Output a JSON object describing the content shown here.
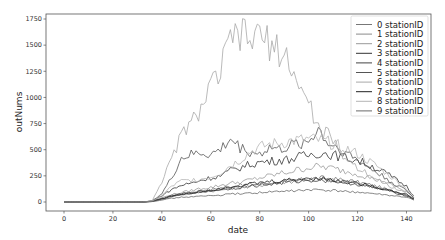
{
  "chart_data": {
    "type": "line",
    "title": "",
    "xlabel": "date",
    "ylabel": "outNums",
    "xlim": [
      -7,
      150
    ],
    "ylim": [
      -90,
      1780
    ],
    "xticks": [
      0,
      20,
      40,
      60,
      80,
      100,
      120,
      140
    ],
    "yticks": [
      0,
      250,
      500,
      750,
      1000,
      1250,
      1500,
      1750
    ],
    "grid": false,
    "legend_position": "upper right",
    "x": [
      0,
      4,
      8,
      12,
      16,
      20,
      24,
      28,
      32,
      36,
      40,
      44,
      48,
      52,
      56,
      60,
      64,
      68,
      72,
      76,
      80,
      84,
      88,
      92,
      96,
      100,
      104,
      108,
      112,
      116,
      120,
      124,
      128,
      132,
      136,
      140,
      143
    ],
    "series": [
      {
        "name": "0 stationID",
        "color": "#777777",
        "values": [
          0,
          0,
          0,
          0,
          0,
          0,
          0,
          0,
          0,
          5,
          30,
          60,
          80,
          95,
          110,
          120,
          135,
          150,
          160,
          170,
          175,
          185,
          190,
          200,
          210,
          220,
          230,
          225,
          215,
          205,
          190,
          170,
          150,
          120,
          95,
          70,
          30
        ]
      },
      {
        "name": "1 stationID",
        "color": "#8a8a8a",
        "values": [
          0,
          0,
          0,
          0,
          0,
          0,
          0,
          0,
          0,
          5,
          25,
          50,
          70,
          80,
          95,
          105,
          115,
          130,
          140,
          150,
          160,
          175,
          185,
          195,
          205,
          220,
          215,
          210,
          200,
          190,
          175,
          160,
          140,
          115,
          90,
          65,
          25
        ]
      },
      {
        "name": "2 stationID",
        "color": "#999999",
        "values": [
          0,
          0,
          0,
          0,
          0,
          0,
          0,
          0,
          0,
          8,
          40,
          70,
          90,
          110,
          130,
          140,
          160,
          180,
          190,
          210,
          230,
          250,
          270,
          290,
          310,
          330,
          340,
          330,
          310,
          290,
          270,
          240,
          210,
          180,
          140,
          100,
          40
        ]
      },
      {
        "name": "3 stationID",
        "color": "#333333",
        "values": [
          0,
          0,
          0,
          0,
          0,
          0,
          0,
          0,
          0,
          10,
          60,
          120,
          160,
          180,
          210,
          230,
          250,
          300,
          330,
          360,
          380,
          390,
          400,
          410,
          430,
          450,
          470,
          460,
          440,
          420,
          400,
          360,
          320,
          270,
          210,
          150,
          60
        ]
      },
      {
        "name": "4 stationID",
        "color": "#444444",
        "values": [
          0,
          0,
          0,
          0,
          0,
          0,
          0,
          0,
          0,
          6,
          35,
          60,
          75,
          90,
          100,
          110,
          120,
          130,
          140,
          150,
          160,
          170,
          180,
          190,
          200,
          210,
          210,
          205,
          195,
          185,
          170,
          150,
          130,
          110,
          85,
          60,
          25
        ]
      },
      {
        "name": "5 stationID",
        "color": "#555555",
        "values": [
          0,
          0,
          0,
          0,
          0,
          0,
          0,
          0,
          0,
          10,
          80,
          230,
          420,
          450,
          470,
          450,
          500,
          600,
          520,
          480,
          460,
          520,
          500,
          530,
          560,
          580,
          700,
          560,
          520,
          460,
          400,
          340,
          280,
          220,
          160,
          110,
          40
        ]
      },
      {
        "name": "6 stationID",
        "color": "#a8a8a8",
        "values": [
          0,
          0,
          0,
          0,
          0,
          0,
          0,
          0,
          0,
          10,
          200,
          400,
          650,
          750,
          900,
          1100,
          1250,
          1550,
          1600,
          1550,
          1600,
          1500,
          1450,
          1350,
          1100,
          950,
          700,
          650,
          500,
          400,
          330,
          280,
          220,
          170,
          120,
          80,
          30
        ]
      },
      {
        "name": "7 stationID",
        "color": "#222222",
        "values": [
          0,
          0,
          0,
          0,
          0,
          0,
          0,
          0,
          0,
          5,
          30,
          55,
          70,
          85,
          100,
          115,
          130,
          150,
          160,
          170,
          180,
          195,
          200,
          210,
          220,
          225,
          230,
          215,
          200,
          190,
          180,
          160,
          140,
          120,
          95,
          70,
          30
        ]
      },
      {
        "name": "8 stationID",
        "color": "#b5b5b5",
        "values": [
          0,
          0,
          0,
          0,
          0,
          0,
          0,
          0,
          0,
          8,
          60,
          150,
          200,
          210,
          220,
          240,
          280,
          350,
          400,
          480,
          520,
          550,
          560,
          580,
          590,
          600,
          590,
          570,
          540,
          500,
          460,
          400,
          340,
          270,
          200,
          130,
          50
        ]
      },
      {
        "name": "9 stationID",
        "color": "#6a6a6a",
        "values": [
          0,
          0,
          0,
          0,
          0,
          0,
          0,
          0,
          0,
          4,
          20,
          35,
          45,
          50,
          55,
          60,
          65,
          75,
          80,
          85,
          90,
          95,
          100,
          105,
          110,
          115,
          115,
          110,
          105,
          100,
          95,
          85,
          75,
          65,
          55,
          45,
          20
        ]
      }
    ]
  }
}
